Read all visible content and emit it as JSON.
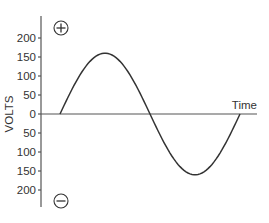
{
  "chart_data": {
    "type": "line",
    "title": "",
    "xlabel": "Time",
    "ylabel": "VOLTS",
    "ylim": [
      -200,
      200
    ],
    "y_ticks": [
      200,
      150,
      100,
      50,
      0,
      -50,
      -100,
      -150,
      -200
    ],
    "y_tick_labels": [
      "200",
      "150",
      "100",
      "50",
      "0",
      "50",
      "100",
      "150",
      "200"
    ],
    "grid": false,
    "legend": null,
    "annotations": [
      {
        "symbol": "plus-in-circle",
        "position": "top",
        "meaning": "positive"
      },
      {
        "symbol": "minus-in-circle",
        "position": "bottom",
        "meaning": "negative"
      }
    ],
    "series": [
      {
        "name": "AC voltage sine wave",
        "x": [
          0,
          0.125,
          0.25,
          0.375,
          0.5,
          0.625,
          0.75,
          0.875,
          1.0
        ],
        "values": [
          0,
          113,
          160,
          113,
          0,
          -113,
          -160,
          -113,
          0
        ]
      }
    ],
    "peak_voltage": 160
  },
  "labels": {
    "y_axis_title": "VOLTS",
    "x_axis_title": "Time",
    "plus_symbol": "+",
    "minus_symbol": "−"
  },
  "colors": {
    "line": "#333333",
    "axis": "#555555",
    "text": "#333333",
    "background": "#ffffff"
  }
}
